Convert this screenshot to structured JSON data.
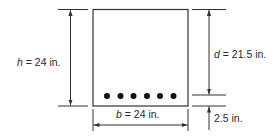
{
  "diagram": {
    "labels": {
      "h_var": "h",
      "h_value": " = 24 in.",
      "d_var": "d",
      "d_value": " = 21.5 in.",
      "b_var": "b",
      "b_value": " = 24 in.",
      "cover": "2.5 in."
    },
    "dimensions": {
      "h_in": 24,
      "d_in": 21.5,
      "b_in": 24,
      "cover_in": 2.5
    },
    "reinforcement": {
      "bar_count": 6
    },
    "colors": {
      "line": "#333333",
      "bars": "#111111",
      "background": "#ffffff"
    }
  }
}
